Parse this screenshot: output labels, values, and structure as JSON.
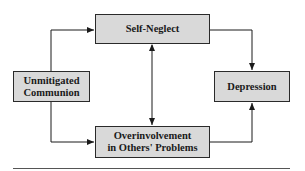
{
  "diagram": {
    "nodes": [
      {
        "id": "unmitigated-communion",
        "label": "Unmitigated Communion",
        "lines": [
          "Unmitigated",
          "Communion"
        ]
      },
      {
        "id": "self-neglect",
        "label": "Self-Neglect",
        "lines": [
          "Self-Neglect"
        ]
      },
      {
        "id": "overinvolvement",
        "label": "Overinvolvement in Others' Problems",
        "lines": [
          "Overinvolvement",
          "in Others' Problems"
        ]
      },
      {
        "id": "depression",
        "label": "Depression",
        "lines": [
          "Depression"
        ]
      }
    ],
    "edges": [
      {
        "from": "unmitigated-communion",
        "to": "self-neglect",
        "direction": "forward"
      },
      {
        "from": "unmitigated-communion",
        "to": "overinvolvement",
        "direction": "forward"
      },
      {
        "from": "self-neglect",
        "to": "overinvolvement",
        "direction": "bidirectional"
      },
      {
        "from": "self-neglect",
        "to": "depression",
        "direction": "forward"
      },
      {
        "from": "overinvolvement",
        "to": "depression",
        "direction": "forward"
      }
    ],
    "colors": {
      "box_fill": "#d9d9d9",
      "stroke": "#2a2a2a"
    }
  }
}
